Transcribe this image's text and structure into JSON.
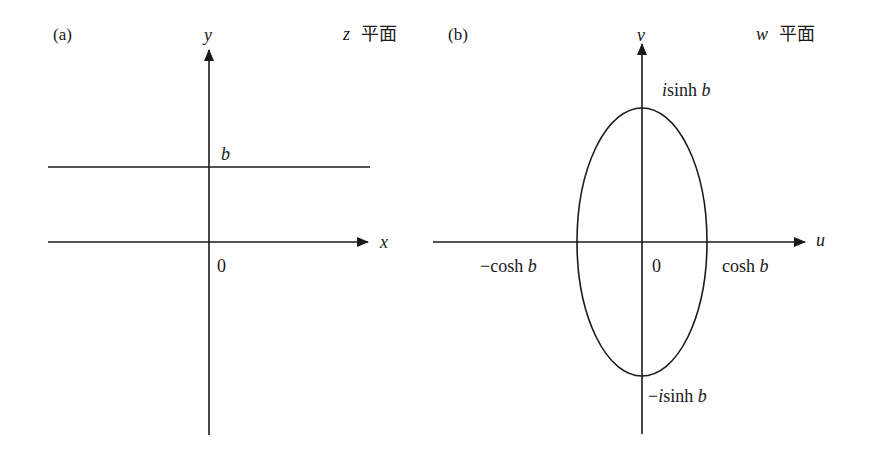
{
  "panels": [
    {
      "id": "a",
      "panel_label": "(a)",
      "plane_var": "z",
      "plane_word": "平面",
      "x_axis_label": "x",
      "y_axis_label": "y",
      "origin_label": "0",
      "line_label": "b",
      "elements": [
        "x-axis arrow",
        "y-axis arrow",
        "horizontal line y = b"
      ]
    },
    {
      "id": "b",
      "panel_label": "(b)",
      "plane_var": "w",
      "plane_word": "平面",
      "x_axis_label": "u",
      "y_axis_label": "v",
      "origin_label": "0",
      "top_label_i": "i",
      "top_label_rest": "sinh ",
      "top_label_b": "b",
      "bottom_label_minus": "−",
      "bottom_label_i": "i",
      "bottom_label_rest": "sinh ",
      "bottom_label_b": "b",
      "left_label_minus": "−",
      "left_label_rest": "cosh ",
      "left_label_b": "b",
      "right_label_rest": "cosh ",
      "right_label_b": "b",
      "elements": [
        "u-axis arrow",
        "v-axis arrow",
        "ellipse with semi-axes cosh b and sinh b"
      ]
    }
  ],
  "colors": {
    "ink": "#1a1a1a",
    "background": "#ffffff"
  }
}
